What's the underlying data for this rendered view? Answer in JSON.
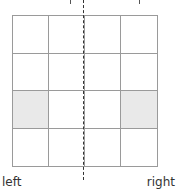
{
  "diagram": {
    "type": "grid-symmetry",
    "rows": 4,
    "cols": 4,
    "shaded_cells": [
      [
        2,
        0
      ],
      [
        2,
        3
      ]
    ],
    "cells": [
      [
        false,
        false,
        false,
        false
      ],
      [
        false,
        false,
        false,
        false
      ],
      [
        true,
        false,
        false,
        true
      ],
      [
        false,
        false,
        false,
        false
      ]
    ],
    "line_of_symmetry": "vertical-dashed",
    "colors": {
      "grid_line": "#9a9a9a",
      "shaded": "#e9e9e9",
      "axis": "#333333"
    }
  },
  "labels": {
    "left": "left",
    "right": "right"
  }
}
